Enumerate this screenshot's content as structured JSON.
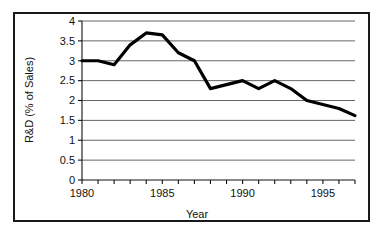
{
  "chart_data": {
    "type": "line",
    "title": "",
    "xlabel": "Year",
    "ylabel": "R&D (% of Sales)",
    "xlim": [
      1980,
      1997
    ],
    "ylim": [
      0,
      4
    ],
    "grid": true,
    "legend": "none",
    "x": [
      1980,
      1981,
      1982,
      1983,
      1984,
      1985,
      1986,
      1987,
      1988,
      1989,
      1990,
      1991,
      1992,
      1993,
      1994,
      1995,
      1996,
      1997
    ],
    "values": [
      3.0,
      3.0,
      2.9,
      3.4,
      3.7,
      3.65,
      3.2,
      3.0,
      2.3,
      2.4,
      2.5,
      2.3,
      2.5,
      2.3,
      2.0,
      1.9,
      1.8,
      1.62
    ],
    "series": [
      {
        "name": "R&D (% of Sales)",
        "color": "#000000",
        "values": [
          3.0,
          3.0,
          2.9,
          3.4,
          3.7,
          3.65,
          3.2,
          3.0,
          2.3,
          2.4,
          2.5,
          2.3,
          2.5,
          2.3,
          2.0,
          1.9,
          1.8,
          1.62
        ]
      }
    ],
    "y_ticks": [
      {
        "value": 4,
        "label": "4"
      },
      {
        "value": 3.5,
        "label": "3.5"
      },
      {
        "value": 3,
        "label": "3"
      },
      {
        "value": 2.5,
        "label": "2.5"
      },
      {
        "value": 2,
        "label": "2"
      },
      {
        "value": 1.5,
        "label": "1.5"
      },
      {
        "value": 1,
        "label": "1"
      },
      {
        "value": 0.5,
        "label": "0.5"
      },
      {
        "value": 0,
        "label": "0"
      }
    ],
    "x_ticks": [
      {
        "value": 1980,
        "label": "1980"
      },
      {
        "value": 1981,
        "label": ""
      },
      {
        "value": 1982,
        "label": ""
      },
      {
        "value": 1983,
        "label": ""
      },
      {
        "value": 1984,
        "label": ""
      },
      {
        "value": 1985,
        "label": "1985"
      },
      {
        "value": 1986,
        "label": ""
      },
      {
        "value": 1987,
        "label": ""
      },
      {
        "value": 1988,
        "label": ""
      },
      {
        "value": 1989,
        "label": ""
      },
      {
        "value": 1990,
        "label": "1990"
      },
      {
        "value": 1991,
        "label": ""
      },
      {
        "value": 1992,
        "label": ""
      },
      {
        "value": 1993,
        "label": ""
      },
      {
        "value": 1994,
        "label": ""
      },
      {
        "value": 1995,
        "label": "1995"
      },
      {
        "value": 1996,
        "label": ""
      },
      {
        "value": 1997,
        "label": ""
      }
    ],
    "colors": {
      "line": "#000000",
      "grid": "#555555",
      "axis": "#111111",
      "border": "#1a1a1a",
      "background": "#ffffff"
    }
  }
}
